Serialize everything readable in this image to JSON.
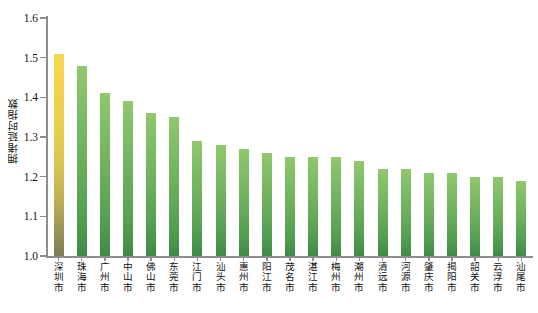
{
  "chart_data": {
    "type": "bar",
    "title": "",
    "xlabel": "",
    "ylabel": "拥堵延时指数",
    "ylim": [
      1.0,
      1.6
    ],
    "ytick_labels": [
      "1.6",
      "1.5",
      "1.4",
      "1.3",
      "1.2",
      "1.1",
      "1.0"
    ],
    "ytick_values": [
      1.6,
      1.5,
      1.4,
      1.3,
      1.2,
      1.1,
      1.0
    ],
    "grid": false,
    "legend": null,
    "categories": [
      "深圳市",
      "珠海市",
      "广州市",
      "中山市",
      "佛山市",
      "东莞市",
      "江门市",
      "汕头市",
      "惠州市",
      "阳江市",
      "茂名市",
      "湛江市",
      "梅州市",
      "潮州市",
      "清远市",
      "河源市",
      "肇庆市",
      "揭阳市",
      "韶关市",
      "云浮市",
      "汕尾市"
    ],
    "values": [
      1.51,
      1.48,
      1.41,
      1.39,
      1.36,
      1.35,
      1.29,
      1.28,
      1.27,
      1.26,
      1.25,
      1.25,
      1.25,
      1.24,
      1.22,
      1.22,
      1.21,
      1.21,
      1.2,
      1.2,
      1.19
    ],
    "highlight_index": 0,
    "colors": {
      "bar_green_top": "#8fc96e",
      "bar_green_bottom": "#3f8a45",
      "bar_highlight_top": "#f6d752",
      "bar_highlight_bottom": "#7d7d55",
      "axis": "#8d8d8d",
      "text": "#111111",
      "background": "#ffffff"
    }
  }
}
